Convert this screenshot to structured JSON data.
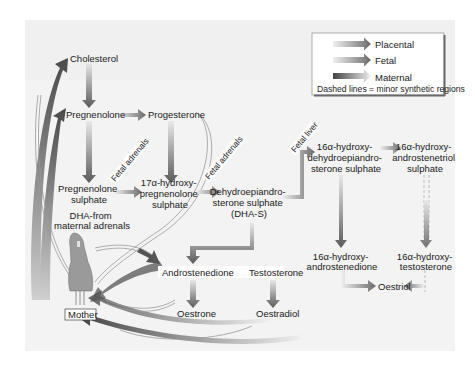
{
  "background": "#f3f3f3",
  "colors": {
    "arrow_dark": "#5a5a5a",
    "arrow_light": "#e0e0e0",
    "text": "#1a1a1a",
    "panel": "#f3f3f3",
    "legend_bg": "#ffffff"
  },
  "legend": {
    "items": [
      {
        "label": "Placental",
        "icon": "gradient-arrow-icon"
      },
      {
        "label": "Fetal",
        "icon": "gradient-arrow-icon"
      },
      {
        "label": "Maternal",
        "icon": "gradient-arrow-icon"
      }
    ],
    "note": "Dashed lines = minor synthetic regions"
  },
  "nodes": {
    "cholesterol": "Cholesterol",
    "pregnenolone": "Pregnenolone",
    "progesterone": "Progesterone",
    "pregnenolone_sulphate": [
      "Pregnenolone",
      "sulphate"
    ],
    "hydroxy_pregnenolone_sulphate": [
      "17α-hydroxy-",
      "pregnenolone",
      "sulphate"
    ],
    "dhas": [
      "Dehydroepiandro-",
      "sterone sulphate",
      "(DHA-S)"
    ],
    "hydroxy_dhas": [
      "16α-hydroxy-",
      "dehydroepiandro-",
      "sterone sulphate"
    ],
    "androstenetriol": [
      "16α-hydroxy-",
      "androstenetriol",
      "sulphate"
    ],
    "dha_maternal": [
      "DHA-from",
      "maternal adrenals"
    ],
    "androstenedione": "Androstenedione",
    "testosterone": "Testosterone",
    "hydroxy_androstenedione": [
      "16α-hydroxy-",
      "androstenedione"
    ],
    "hydroxy_testosterone": [
      "16α-hydroxy-",
      "testosterone"
    ],
    "oestrone": "Oestrone",
    "oestradiol": "Oestradiol",
    "oestriol": "Oestriol",
    "mother": "Mother"
  },
  "route_labels": {
    "fetal_adrenals_1": "Fetal adrenals",
    "fetal_adrenals_2": "Fetal adrenals",
    "fetal_liver": "Fetal liver"
  }
}
